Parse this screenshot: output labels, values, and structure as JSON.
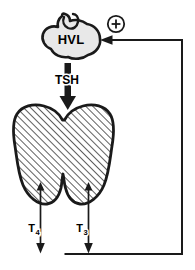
{
  "figure": {
    "name": "thyroid-regulation-feedback-diagram",
    "background_color": "#ffffff",
    "stroke_color": "#1a1a1a",
    "gland_fill": "#e8e8e8",
    "hatch_fill": "#ffffff"
  },
  "pituitary": {
    "label": "HVL",
    "icon": "pituitary-gland-icon",
    "fill": "#e8e8e8"
  },
  "stimulus": {
    "symbol": "⊕",
    "icon": "circle-plus-icon",
    "meaning": "positive"
  },
  "tsh_arrow": {
    "label": "TSH",
    "icon": "thick-down-arrow-icon",
    "direction": "down"
  },
  "thyroid": {
    "icon": "thyroid-gland-icon",
    "pattern": "diagonal-hatch"
  },
  "hormones": [
    {
      "label": "T",
      "subscript": "4",
      "icon": "down-arrow-icon"
    },
    {
      "label": "T",
      "subscript": "3",
      "icon": "down-arrow-icon"
    }
  ],
  "feedback_loop": {
    "name": "feedback-path",
    "icon": "left-arrow-icon",
    "direction": "to-pituitary"
  }
}
